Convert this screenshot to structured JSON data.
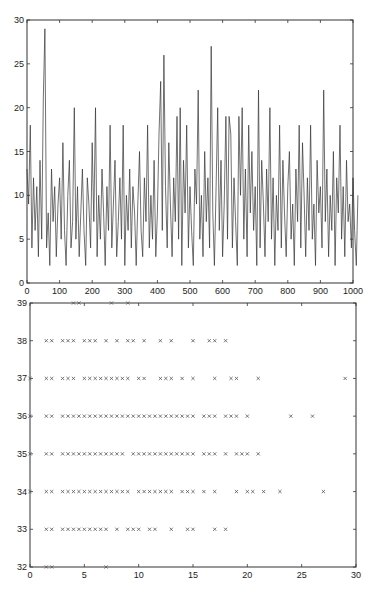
{
  "chart_data": [
    {
      "type": "line",
      "title": "",
      "xlabel": "",
      "ylabel": "",
      "xlim": [
        0,
        1000
      ],
      "ylim": [
        0,
        30
      ],
      "grid": false,
      "xticks": [
        0,
        100,
        200,
        300,
        400,
        500,
        600,
        700,
        800,
        900,
        1000
      ],
      "yticks": [
        0,
        5,
        10,
        15,
        20,
        25,
        30
      ],
      "line_color": "#333333",
      "x_step": 5,
      "values": [
        13,
        9,
        18,
        4,
        12,
        6,
        11,
        3,
        14,
        5,
        21,
        29,
        4,
        8,
        2,
        13,
        7,
        11,
        3,
        9,
        12,
        5,
        16,
        6,
        2,
        10,
        14,
        4,
        7,
        20,
        5,
        11,
        3,
        8,
        13,
        6,
        2,
        12,
        9,
        4,
        16,
        7,
        20,
        3,
        10,
        5,
        13,
        8,
        2,
        11,
        6,
        18,
        4,
        9,
        14,
        3,
        7,
        12,
        5,
        18,
        2,
        10,
        6,
        13,
        4,
        11,
        8,
        2,
        9,
        15,
        6,
        3,
        12,
        7,
        18,
        4,
        10,
        5,
        14,
        3,
        8,
        17,
        23,
        6,
        26,
        11,
        4,
        16,
        9,
        3,
        12,
        7,
        19,
        5,
        20,
        2,
        14,
        8,
        18,
        4,
        11,
        6,
        2,
        13,
        9,
        22,
        5,
        10,
        3,
        15,
        7,
        12,
        4,
        27,
        8,
        2,
        11,
        20,
        6,
        14,
        3,
        9,
        19,
        5,
        19,
        17,
        4,
        12,
        7,
        2,
        19,
        10,
        20,
        5,
        13,
        3,
        18,
        8,
        15,
        6,
        11,
        2,
        22,
        4,
        14,
        9,
        3,
        13,
        7,
        20,
        5,
        12,
        2,
        10,
        6,
        18,
        4,
        14,
        8,
        3,
        11,
        15,
        5,
        9,
        2,
        13,
        7,
        18,
        4,
        16,
        10,
        3,
        12,
        6,
        18,
        5,
        9,
        2,
        14,
        8,
        11,
        4,
        22,
        7,
        13,
        3,
        10,
        6,
        15,
        2,
        12,
        8,
        18,
        5,
        11,
        3,
        14,
        7,
        9,
        4,
        12,
        6,
        2,
        10
      ]
    },
    {
      "type": "scatter",
      "title": "",
      "xlabel": "",
      "ylabel": "",
      "xlim": [
        0,
        30
      ],
      "ylim": [
        32,
        39
      ],
      "grid": false,
      "marker": "x",
      "xticks": [
        0,
        5,
        10,
        15,
        20,
        25,
        30
      ],
      "yticks": [
        32,
        33,
        34,
        35,
        36,
        37,
        38,
        39
      ],
      "rows": [
        {
          "y": 39,
          "x": [
            4,
            4.5,
            7.5,
            9
          ]
        },
        {
          "y": 38,
          "x": [
            1.5,
            2,
            3,
            3.5,
            4,
            5,
            5.5,
            6,
            7,
            8,
            9,
            9.5,
            10.5,
            12,
            13,
            15,
            16.5,
            17,
            18
          ]
        },
        {
          "y": 37,
          "x": [
            0,
            1.5,
            2,
            3,
            3.5,
            4,
            5,
            5.5,
            6,
            6.5,
            7,
            7.5,
            8,
            8.5,
            9,
            10,
            10.5,
            12,
            12.5,
            13,
            14,
            15,
            17,
            18.5,
            19,
            21,
            29
          ]
        },
        {
          "y": 36,
          "x": [
            0,
            1.5,
            2,
            3,
            3.5,
            4,
            4.5,
            5,
            5.5,
            6,
            6.5,
            7,
            7.5,
            8,
            8.5,
            9,
            9.5,
            10,
            10.5,
            11,
            11.5,
            12,
            12.5,
            13,
            13.5,
            14,
            14.5,
            15,
            16,
            16.5,
            17,
            18,
            18.5,
            19,
            20,
            24,
            26
          ]
        },
        {
          "y": 35,
          "x": [
            0,
            1.5,
            2,
            3,
            3.5,
            4,
            4.5,
            5,
            5.5,
            6,
            6.5,
            7,
            7.5,
            8,
            8.5,
            9.5,
            10,
            10.5,
            11,
            11.5,
            12,
            12.5,
            13,
            13.5,
            14,
            14.5,
            15,
            16,
            16.5,
            17,
            18,
            19,
            19.5,
            20,
            21
          ]
        },
        {
          "y": 34,
          "x": [
            0,
            1.5,
            2,
            3,
            3.5,
            4,
            4.5,
            5,
            5.5,
            6,
            6.5,
            7,
            7.5,
            8,
            8.5,
            9,
            10,
            10.5,
            11,
            11.5,
            12,
            12.5,
            13,
            14,
            14.5,
            15,
            16,
            17,
            19,
            20,
            20.5,
            21.5,
            23,
            27
          ]
        },
        {
          "y": 33,
          "x": [
            1.5,
            2,
            3,
            3.5,
            4,
            4.5,
            5,
            5.5,
            6,
            6.5,
            7,
            8,
            9,
            9.5,
            10,
            11,
            11.5,
            13,
            14.5,
            15,
            17,
            18
          ]
        },
        {
          "y": 32,
          "x": [
            1.5,
            2,
            7
          ]
        }
      ]
    }
  ]
}
